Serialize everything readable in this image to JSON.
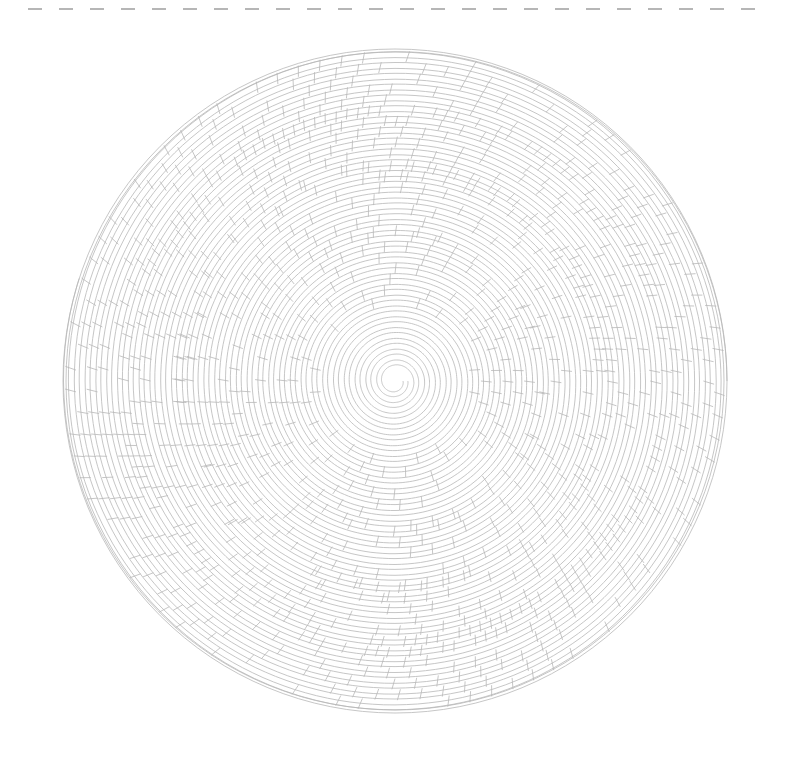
{
  "image": {
    "description": "Line-art drawing of a dense circular spiral made of concentric grooves with cellular/honeycomb breaks, above it a horizontal dashed line",
    "background": "#ffffff",
    "stroke_color": "#b8b8b8",
    "dash_color": "#6e6e6e"
  },
  "dashed_line": {
    "x1": 28,
    "x2": 770,
    "y": 9,
    "dash": 14,
    "gap": 17
  },
  "spiral": {
    "center_x": 395,
    "center_y": 381,
    "outer_radius": 332,
    "inner_radius": 8,
    "turns": 30,
    "cell_rings": [
      0.34,
      0.55,
      0.72,
      0.88
    ]
  }
}
